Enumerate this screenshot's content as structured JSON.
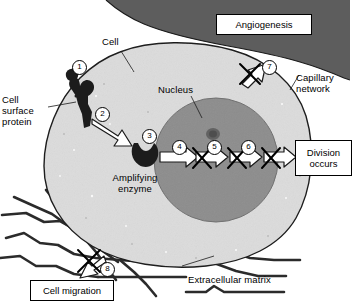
{
  "figure": {
    "colors": {
      "capillary_dark": "#5d5d5d",
      "cytoplasm": "#dcdcdc",
      "nucleus": "#8d8d8d",
      "nucleolus": "#5a5a5a",
      "outline": "#1a1a1a",
      "matrix_fiber": "#2b2b2b",
      "arrow_fill": "#ffffff",
      "protein_dark": "#1c1c1c",
      "background": "#ffffff"
    }
  },
  "labels": {
    "cell": "Cell",
    "nucleus": "Nucleus",
    "cell_surface_protein": "Cell\nsurface\nprotein",
    "amplifying_enzyme": "Amplifying\nenzyme",
    "capillary_network": "Capillary\nnetwork",
    "extracellular_matrix": "Extracellular matrix"
  },
  "boxes": {
    "angiogenesis": "Angiogenesis",
    "division_occurs": "Division\noccurs",
    "cell_migration": "Cell migration"
  },
  "steps": [
    {
      "id": "1",
      "number": "1",
      "meaning": "ligand binds cell surface protein"
    },
    {
      "id": "2",
      "number": "2",
      "meaning": "signal passed to amplifying enzyme"
    },
    {
      "id": "3",
      "number": "3",
      "meaning": "amplifying enzyme activated"
    },
    {
      "id": "4",
      "number": "4",
      "meaning": "signal step blocked"
    },
    {
      "id": "5",
      "number": "5",
      "meaning": "signal step blocked"
    },
    {
      "id": "6",
      "number": "6",
      "meaning": "signal step blocked before division"
    },
    {
      "id": "7",
      "number": "7",
      "meaning": "angiogenesis blocked"
    },
    {
      "id": "8",
      "number": "8",
      "meaning": "cell migration blocked"
    }
  ]
}
